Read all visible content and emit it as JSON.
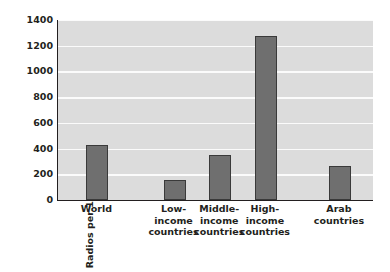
{
  "chart_data": {
    "type": "bar",
    "title": "",
    "xlabel": "",
    "ylabel": "Radios per 1000 people",
    "categories": [
      "World",
      "Low-\nincome\ncountries",
      "Middle-\nincome\ncountries",
      "High-\nincome\ncountries",
      "Arab\ncountries"
    ],
    "values": [
      425,
      155,
      352,
      1275,
      266
    ],
    "ylim": [
      0,
      1400
    ],
    "ytick_labels": [
      "0",
      "200",
      "400",
      "600",
      "800",
      "1000",
      "1200",
      "1400"
    ],
    "ytick_values": [
      0,
      200,
      400,
      600,
      800,
      1000,
      1200,
      1400
    ],
    "grid": true,
    "legend": "none",
    "colors": {
      "bar_fill": "#6f6f6f",
      "bar_edge": "#3a3a3a",
      "plot_background": "#dcdcdc",
      "gridline": "#fbfbfb",
      "axis_line": "#231f20",
      "text": "#231f20",
      "figure_background": "#ffffff"
    },
    "bar_positions_pct": [
      {
        "center": 12.5,
        "width": 7.0
      },
      {
        "center": 37.0,
        "width": 7.0
      },
      {
        "center": 51.5,
        "width": 7.0
      },
      {
        "center": 66.0,
        "width": 7.0
      },
      {
        "center": 89.5,
        "width": 7.0
      }
    ]
  }
}
